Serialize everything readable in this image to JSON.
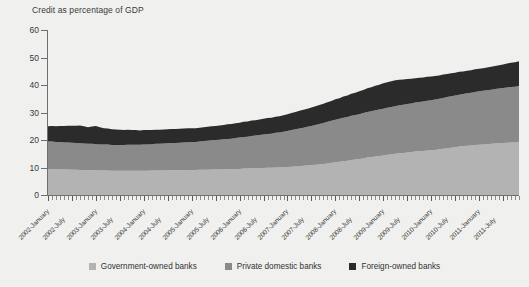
{
  "figure": {
    "background_color": "#f0f0ee",
    "axis_color": "#6f6f6f",
    "text_color": "#3a3a3a"
  },
  "legend": {
    "position": "bottom-center",
    "items": [
      {
        "label": "Government-owned banks",
        "color": "#b3b3b3"
      },
      {
        "label": "Private domestic banks",
        "color": "#8a8a8a"
      },
      {
        "label": "Foreign-owned banks",
        "color": "#2b2b2b"
      }
    ]
  },
  "chart_data": {
    "type": "area",
    "stacked": true,
    "title": "Credit as percentage of GDP",
    "subtitle": "",
    "xlabel": "",
    "ylabel": "Credit as percentage of GDP",
    "ylim": [
      0,
      60
    ],
    "yticks": [
      0,
      10,
      20,
      30,
      40,
      50,
      60
    ],
    "ytick_labels": [
      "0",
      "10",
      "20",
      "30",
      "40",
      "50",
      "60"
    ],
    "grid": false,
    "legend_position": "bottom",
    "x_tick_labels": [
      "2002-January",
      "2002-July",
      "2003-January",
      "2003-July",
      "2004-January",
      "2004-July",
      "2005-January",
      "2005-July",
      "2006-January",
      "2006-July",
      "2007-January",
      "2007-July",
      "2008-January",
      "2008-July",
      "2009-January",
      "2009-July",
      "2010-January",
      "2010-July",
      "2011-January",
      "2011-July"
    ],
    "x_minor_count": 116,
    "x": [
      "2002-01",
      "2002-02",
      "2002-03",
      "2002-04",
      "2002-05",
      "2002-06",
      "2002-07",
      "2002-08",
      "2002-09",
      "2002-10",
      "2002-11",
      "2002-12",
      "2003-01",
      "2003-02",
      "2003-03",
      "2003-04",
      "2003-05",
      "2003-06",
      "2003-07",
      "2003-08",
      "2003-09",
      "2003-10",
      "2003-11",
      "2003-12",
      "2004-01",
      "2004-02",
      "2004-03",
      "2004-04",
      "2004-05",
      "2004-06",
      "2004-07",
      "2004-08",
      "2004-09",
      "2004-10",
      "2004-11",
      "2004-12",
      "2005-01",
      "2005-02",
      "2005-03",
      "2005-04",
      "2005-05",
      "2005-06",
      "2005-07",
      "2005-08",
      "2005-09",
      "2005-10",
      "2005-11",
      "2005-12",
      "2006-01",
      "2006-02",
      "2006-03",
      "2006-04",
      "2006-05",
      "2006-06",
      "2006-07",
      "2006-08",
      "2006-09",
      "2006-10",
      "2006-11",
      "2006-12",
      "2007-01",
      "2007-02",
      "2007-03",
      "2007-04",
      "2007-05",
      "2007-06",
      "2007-07",
      "2007-08",
      "2007-09",
      "2007-10",
      "2007-11",
      "2007-12",
      "2008-01",
      "2008-02",
      "2008-03",
      "2008-04",
      "2008-05",
      "2008-06",
      "2008-07",
      "2008-08",
      "2008-09",
      "2008-10",
      "2008-11",
      "2008-12",
      "2009-01",
      "2009-02",
      "2009-03",
      "2009-04",
      "2009-05",
      "2009-06",
      "2009-07",
      "2009-08",
      "2009-09",
      "2009-10",
      "2009-11",
      "2009-12",
      "2010-01",
      "2010-02",
      "2010-03",
      "2010-04",
      "2010-05",
      "2010-06",
      "2010-07",
      "2010-08",
      "2010-09",
      "2010-10",
      "2010-11",
      "2010-12",
      "2011-01",
      "2011-02",
      "2011-03",
      "2011-04",
      "2011-05",
      "2011-06",
      "2011-07",
      "2011-08",
      "2011-09",
      "2011-10",
      "2011-11"
    ],
    "series": [
      {
        "name": "Government-owned banks",
        "color": "#b3b3b3",
        "values": [
          9.5,
          9.5,
          9.4,
          9.4,
          9.3,
          9.3,
          9.2,
          9.2,
          9.1,
          9.1,
          9.0,
          9.0,
          9.0,
          8.9,
          8.9,
          8.9,
          8.8,
          8.8,
          8.8,
          8.8,
          8.8,
          8.8,
          8.8,
          8.8,
          8.8,
          8.8,
          8.9,
          8.9,
          8.9,
          8.9,
          9.0,
          9.0,
          9.0,
          9.0,
          9.1,
          9.1,
          9.1,
          9.1,
          9.2,
          9.2,
          9.2,
          9.3,
          9.3,
          9.3,
          9.4,
          9.4,
          9.4,
          9.5,
          9.5,
          9.6,
          9.6,
          9.7,
          9.7,
          9.8,
          9.8,
          9.9,
          9.9,
          10.0,
          10.0,
          10.1,
          10.2,
          10.3,
          10.4,
          10.5,
          10.6,
          10.7,
          10.8,
          11.0,
          11.1,
          11.3,
          11.5,
          11.7,
          11.9,
          12.1,
          12.3,
          12.5,
          12.7,
          12.9,
          13.1,
          13.3,
          13.6,
          13.8,
          14.0,
          14.2,
          14.4,
          14.6,
          14.8,
          15.0,
          15.2,
          15.3,
          15.5,
          15.6,
          15.8,
          15.9,
          16.0,
          16.2,
          16.3,
          16.4,
          16.6,
          16.8,
          17.0,
          17.2,
          17.4,
          17.6,
          17.7,
          17.9,
          18.0,
          18.2,
          18.3,
          18.4,
          18.5,
          18.6,
          18.7,
          18.8,
          18.9,
          19.0,
          19.1,
          19.1,
          19.2
        ]
      },
      {
        "name": "Private domestic banks",
        "color": "#8a8a8a",
        "values": [
          10.0,
          10.0,
          9.9,
          9.9,
          9.8,
          9.8,
          9.8,
          9.7,
          9.7,
          9.6,
          9.6,
          9.6,
          9.5,
          9.5,
          9.5,
          9.5,
          9.4,
          9.4,
          9.4,
          9.4,
          9.5,
          9.5,
          9.5,
          9.5,
          9.6,
          9.6,
          9.6,
          9.7,
          9.7,
          9.8,
          9.8,
          9.9,
          9.9,
          10.0,
          10.0,
          10.1,
          10.2,
          10.2,
          10.3,
          10.4,
          10.5,
          10.6,
          10.7,
          10.8,
          10.9,
          11.0,
          11.1,
          11.2,
          11.4,
          11.5,
          11.6,
          11.8,
          11.9,
          12.0,
          12.2,
          12.3,
          12.4,
          12.6,
          12.7,
          12.9,
          13.1,
          13.3,
          13.5,
          13.7,
          13.9,
          14.1,
          14.3,
          14.5,
          14.7,
          14.9,
          15.1,
          15.3,
          15.5,
          15.6,
          15.8,
          15.9,
          16.1,
          16.2,
          16.3,
          16.5,
          16.6,
          16.7,
          16.8,
          16.9,
          17.0,
          17.1,
          17.2,
          17.3,
          17.4,
          17.5,
          17.6,
          17.7,
          17.8,
          17.9,
          18.0,
          18.1,
          18.2,
          18.3,
          18.4,
          18.5,
          18.6,
          18.7,
          18.8,
          18.9,
          19.0,
          19.1,
          19.2,
          19.3,
          19.4,
          19.5,
          19.6,
          19.7,
          19.8,
          19.9,
          20.0,
          20.1,
          20.2,
          20.3,
          20.4
        ]
      },
      {
        "name": "Foreign-owned banks",
        "color": "#2b2b2b",
        "values": [
          5.5,
          5.6,
          5.7,
          5.8,
          6.0,
          6.1,
          6.2,
          6.3,
          6.5,
          6.3,
          6.0,
          6.3,
          6.6,
          6.2,
          5.9,
          5.8,
          5.7,
          5.6,
          5.5,
          5.4,
          5.4,
          5.3,
          5.3,
          5.2,
          5.2,
          5.2,
          5.1,
          5.1,
          5.1,
          5.1,
          5.1,
          5.1,
          5.1,
          5.1,
          5.1,
          5.1,
          5.0,
          5.0,
          5.0,
          5.0,
          5.1,
          5.1,
          5.1,
          5.2,
          5.2,
          5.3,
          5.3,
          5.4,
          5.4,
          5.5,
          5.5,
          5.6,
          5.6,
          5.7,
          5.7,
          5.8,
          5.8,
          5.9,
          5.9,
          6.0,
          6.1,
          6.2,
          6.3,
          6.4,
          6.5,
          6.6,
          6.7,
          6.8,
          6.9,
          7.0,
          7.1,
          7.2,
          7.4,
          7.5,
          7.7,
          7.8,
          8.0,
          8.1,
          8.3,
          8.4,
          8.6,
          8.7,
          8.9,
          9.0,
          9.2,
          9.3,
          9.4,
          9.4,
          9.3,
          9.2,
          9.1,
          9.0,
          8.9,
          8.8,
          8.7,
          8.7,
          8.6,
          8.6,
          8.5,
          8.5,
          8.4,
          8.4,
          8.3,
          8.3,
          8.2,
          8.2,
          8.2,
          8.2,
          8.2,
          8.2,
          8.3,
          8.3,
          8.4,
          8.5,
          8.6,
          8.7,
          8.8,
          8.9,
          9.0
        ]
      }
    ],
    "totals_note": "Stacked total rises from about 25% of GDP in 2002 to about 48% in late 2011"
  }
}
